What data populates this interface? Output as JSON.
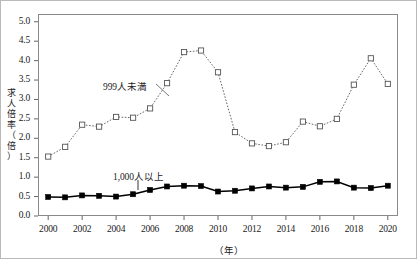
{
  "chart_data": {
    "type": "line",
    "title": "",
    "xlabel": "（年）",
    "ylabel": "求人倍率（倍）",
    "x": [
      2000,
      2001,
      2002,
      2003,
      2004,
      2005,
      2006,
      2007,
      2008,
      2009,
      2010,
      2011,
      2012,
      2013,
      2014,
      2015,
      2016,
      2017,
      2018,
      2019,
      2020
    ],
    "xlim": [
      1999.4,
      2020.6
    ],
    "ylim": [
      0.0,
      5.2
    ],
    "xticks": [
      2000,
      2002,
      2004,
      2006,
      2008,
      2010,
      2012,
      2014,
      2016,
      2018,
      2020
    ],
    "xtick_labels": [
      "2000",
      "2002",
      "2004",
      "2006",
      "2008",
      "2010",
      "2012",
      "2014",
      "2016",
      "2018",
      "2020"
    ],
    "yticks": [
      0.0,
      0.5,
      1.0,
      1.5,
      2.0,
      2.5,
      3.0,
      3.5,
      4.0,
      4.5,
      5.0
    ],
    "ytick_labels": [
      "0.0",
      "0.5",
      "1.0",
      "1.5",
      "2.0",
      "2.5",
      "3.0",
      "3.5",
      "4.0",
      "4.5",
      "5.0"
    ],
    "grid": false,
    "legend_position": "inline-annotation",
    "series": [
      {
        "name": "999人未満",
        "marker": "open-square",
        "linestyle": "dotted",
        "color": "#555555",
        "values": [
          1.53,
          1.78,
          2.35,
          2.3,
          2.55,
          2.53,
          2.77,
          3.42,
          4.22,
          4.26,
          3.7,
          2.16,
          1.87,
          1.8,
          1.9,
          2.43,
          2.31,
          2.5,
          3.38,
          4.06,
          3.4
        ]
      },
      {
        "name": "1,000人以上",
        "marker": "filled-square",
        "linestyle": "solid",
        "color": "#000000",
        "values": [
          0.49,
          0.48,
          0.53,
          0.52,
          0.5,
          0.56,
          0.67,
          0.76,
          0.78,
          0.77,
          0.63,
          0.65,
          0.71,
          0.76,
          0.73,
          0.75,
          0.88,
          0.89,
          0.73,
          0.72,
          0.78
        ]
      }
    ],
    "annotations": [
      {
        "text": "999人未満",
        "series": "999人未満"
      },
      {
        "text": "1,000人以上",
        "series": "1,000人以上"
      }
    ]
  },
  "axis": {
    "y_title_chars": [
      "求",
      "人",
      "倍",
      "率",
      "（",
      "倍",
      "）"
    ],
    "x_unit": "（年）"
  }
}
